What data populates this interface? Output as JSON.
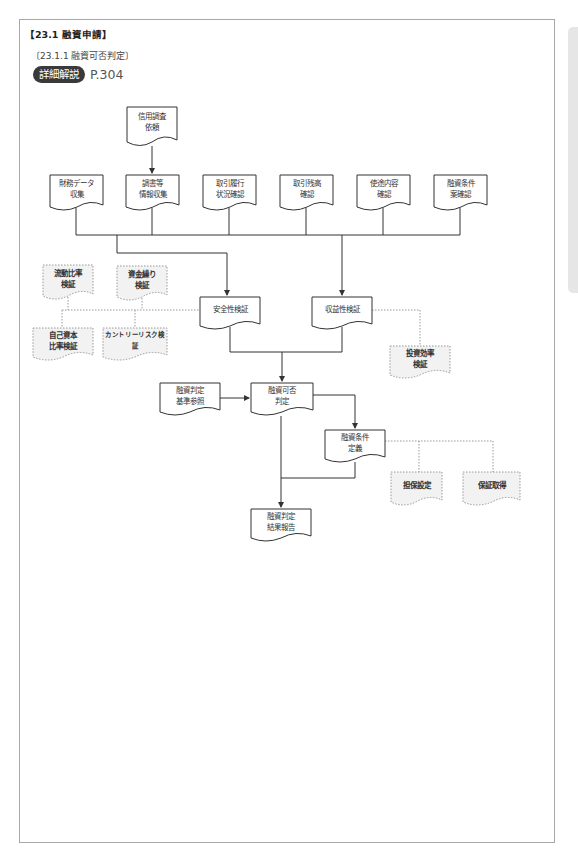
{
  "header": {
    "section_title": "【23.1  融資申請】",
    "subsection_title": "〔23.1.1  融資可否判定〕",
    "reference_badge": "詳細解説",
    "reference_page": "P.304"
  },
  "diagram": {
    "nodes": {
      "credit_request": "信用調査\n依頼",
      "financial_data": "財務データ\n収集",
      "survey_info": "調書等\n情報収集",
      "transaction_history": "取引履行\n状況確認",
      "transaction_balance": "取引残高\n確認",
      "usage_check": "使途内容\n確認",
      "loan_terms_check": "融資条件\n案確認",
      "current_ratio": "流動比率\n検証",
      "cash_flow": "資金繰り\n検証",
      "safety_check": "安全性検証",
      "profitability_check": "収益性検証",
      "equity_ratio": "自己資本\n比率検証",
      "country_risk": "カントリーリスク検証",
      "investment_efficiency": "投資効率\n検証",
      "criteria_reference": "融資判定\n基準参照",
      "approval_decision": "融資可否\n判定",
      "loan_terms_definition": "融資条件\n定義",
      "collateral": "担保設定",
      "guarantee": "保証取得",
      "result_report": "融資判定\n結果報告"
    },
    "colors": {
      "line": "#333333",
      "dotted_line": "#999999",
      "optional_fill": "#f2f2f2",
      "frame": "#a8a8a8",
      "badge": "#3a3a3a"
    }
  }
}
